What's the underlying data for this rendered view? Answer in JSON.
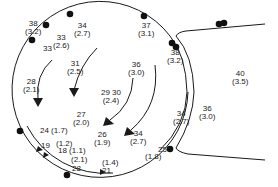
{
  "diagram": {
    "type": "flow-circulation-map",
    "stroke_color": "#1a1a1a",
    "dot_color": "#111111",
    "background": "#ffffff",
    "labels": [
      {
        "id": "l1",
        "value": "38",
        "sub": "(3.2)",
        "x": 25,
        "y": 20
      },
      {
        "id": "l2",
        "value": "34",
        "sub": "(2.7)",
        "x": 74,
        "y": 22
      },
      {
        "id": "l3",
        "value": "33",
        "sub": "(2.6)",
        "x": 53,
        "y": 34
      },
      {
        "id": "l4",
        "value": "33",
        "sub": "",
        "x": 43,
        "y": 45
      },
      {
        "id": "l5",
        "value": "37",
        "sub": "(3.1)",
        "x": 138,
        "y": 22
      },
      {
        "id": "l6",
        "value": "31",
        "sub": "(2.5)",
        "x": 67,
        "y": 60
      },
      {
        "id": "l7",
        "value": "36",
        "sub": "(3.0)",
        "x": 128,
        "y": 61
      },
      {
        "id": "l8",
        "value": "38",
        "sub": "(3.2)",
        "x": 167,
        "y": 49
      },
      {
        "id": "l9",
        "value": "28",
        "sub": "(2.1)",
        "x": 23,
        "y": 78
      },
      {
        "id": "l10",
        "value": "29  30",
        "sub": "(2.4)",
        "x": 101,
        "y": 89
      },
      {
        "id": "l11",
        "value": "27",
        "sub": "(2.0)",
        "x": 73,
        "y": 111
      },
      {
        "id": "l12",
        "value": "40",
        "sub": "(3.5)",
        "x": 232,
        "y": 70
      },
      {
        "id": "l13",
        "value": "36",
        "sub": "(3.0)",
        "x": 199,
        "y": 105
      },
      {
        "id": "l14",
        "value": "34",
        "sub": "(2.7)",
        "x": 173,
        "y": 110
      },
      {
        "id": "l15",
        "value": "34",
        "sub": "(2.7)",
        "x": 130,
        "y": 130
      },
      {
        "id": "l16",
        "value": "26",
        "sub": "(1.9)",
        "x": 94,
        "y": 131
      },
      {
        "id": "l17",
        "value": "24 (1.7)",
        "sub": "",
        "x": 40,
        "y": 127
      },
      {
        "id": "l18",
        "value": "19",
        "sub": "",
        "x": 41,
        "y": 142
      },
      {
        "id": "l19",
        "value": "(1.2)",
        "sub": "",
        "x": 56,
        "y": 140
      },
      {
        "id": "l20",
        "value": "18 (1.1)",
        "sub": "",
        "x": 58,
        "y": 147
      },
      {
        "id": "l21",
        "value": "25",
        "sub": "",
        "x": 158,
        "y": 146
      },
      {
        "id": "l22",
        "value": "(1.8)",
        "sub": "",
        "x": 145,
        "y": 153
      },
      {
        "id": "l23",
        "value": "(2.1)",
        "sub": "",
        "x": 71,
        "y": 156
      },
      {
        "id": "l24",
        "value": "28",
        "sub": "",
        "x": 72,
        "y": 165
      },
      {
        "id": "l25",
        "value": "(1.4)",
        "sub": "",
        "x": 102,
        "y": 159
      },
      {
        "id": "l26",
        "value": "21",
        "sub": "",
        "x": 102,
        "y": 167
      }
    ]
  }
}
